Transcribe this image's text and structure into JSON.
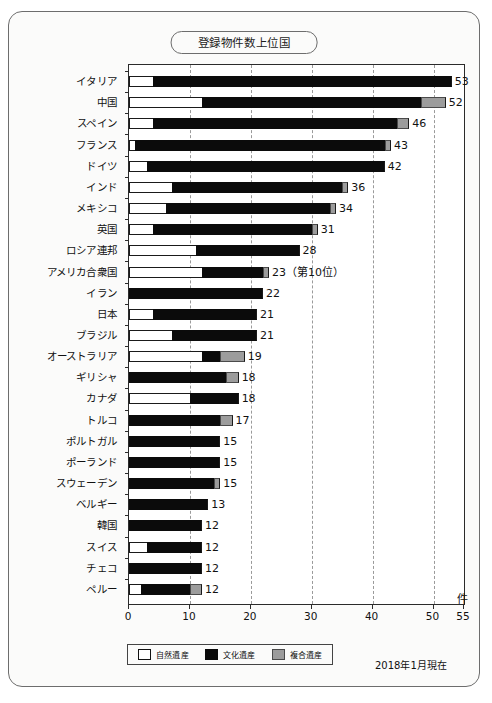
{
  "title": "登録物件数上位国",
  "unit_label": "件",
  "as_of": "2018年1月現在",
  "legend": {
    "items": [
      {
        "label": "自然遺産",
        "key": "natural",
        "color": "#ffffff"
      },
      {
        "label": "文化遺産",
        "key": "cultural",
        "color": "#090909"
      },
      {
        "label": "複合遺産",
        "key": "mixed",
        "color": "#9c9c9c"
      }
    ]
  },
  "chart_data": {
    "type": "bar",
    "orientation": "horizontal",
    "stacked": true,
    "title": "登録物件数上位国",
    "xlabel": "件",
    "ylabel": "",
    "xlim": [
      0,
      55
    ],
    "xticks": [
      0,
      10,
      20,
      30,
      40,
      50,
      55
    ],
    "grid": true,
    "gridlines_at": [
      10,
      20,
      30,
      40,
      50
    ],
    "legend_position": "bottom",
    "annotations": [
      "2018年1月現在"
    ],
    "categories": [
      "イタリア",
      "中国",
      "スペイン",
      "フランス",
      "ドイツ",
      "インド",
      "メキシコ",
      "英国",
      "ロシア連邦",
      "アメリカ合衆国",
      "イラン",
      "日本",
      "ブラジル",
      "オーストラリア",
      "ギリシャ",
      "カナダ",
      "トルコ",
      "ポルトガル",
      "ポーランド",
      "スウェーデン",
      "ベルギー",
      "韓国",
      "スイス",
      "チェコ",
      "ペルー"
    ],
    "series": [
      {
        "name": "自然遺産",
        "values": [
          4,
          12,
          4,
          1,
          3,
          7,
          6,
          4,
          11,
          12,
          0,
          4,
          7,
          12,
          0,
          10,
          0,
          0,
          0,
          0,
          0,
          0,
          3,
          0,
          2
        ]
      },
      {
        "name": "文化遺産",
        "values": [
          49,
          36,
          40,
          41,
          39,
          28,
          27,
          26,
          17,
          10,
          22,
          17,
          14,
          3,
          16,
          8,
          15,
          15,
          15,
          14,
          13,
          12,
          9,
          12,
          8
        ]
      },
      {
        "name": "複合遺産",
        "values": [
          0,
          4,
          2,
          1,
          0,
          1,
          1,
          1,
          0,
          1,
          0,
          0,
          0,
          4,
          2,
          0,
          2,
          0,
          0,
          1,
          0,
          0,
          0,
          0,
          2
        ]
      }
    ],
    "totals": [
      53,
      52,
      46,
      43,
      42,
      36,
      34,
      31,
      28,
      23,
      22,
      21,
      21,
      19,
      18,
      18,
      17,
      15,
      15,
      15,
      13,
      12,
      12,
      12,
      12
    ],
    "value_labels": [
      "53",
      "52",
      "46",
      "43",
      "42",
      "36",
      "34",
      "31",
      "28",
      "23（第10位）",
      "22",
      "21",
      "21",
      "19",
      "18",
      "18",
      "17",
      "15",
      "15",
      "15",
      "13",
      "12",
      "12",
      "12",
      "12"
    ]
  }
}
